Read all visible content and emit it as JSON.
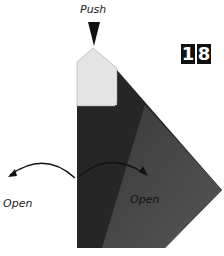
{
  "diagram": {
    "type": "origami-instruction-step",
    "step_number": "18",
    "step_digits": [
      "1",
      "8"
    ],
    "labels": {
      "push": "Push",
      "open_left": "Open",
      "open_right": "Open"
    },
    "colors": {
      "paper_light": "#e6e6e6",
      "paper_dark": "#2a2a2a",
      "paper_mid": "#4a4a4a",
      "ink": "#111111"
    }
  }
}
